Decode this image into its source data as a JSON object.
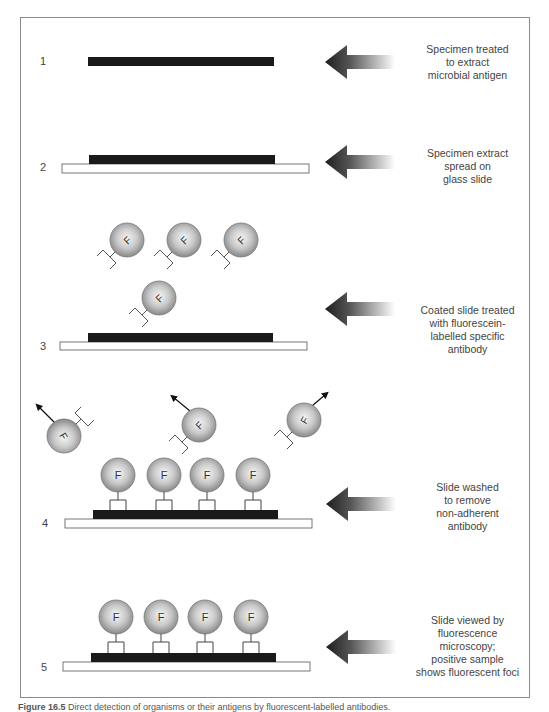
{
  "figure": {
    "caption_label": "Figure 16.5",
    "caption_text": " Direct detection of organisms or their antigens by fluorescent-labelled antibodies.",
    "colors": {
      "frame": "#8a8a8a",
      "antigen_band": "#1a1a1a",
      "slide_fill": "#ffffff",
      "slide_stroke": "#555555",
      "sphere_light": "#f4f4f4",
      "sphere_dark": "#8c8c8c",
      "arrow_dark": "#1e1e1e",
      "arrow_light": "#ffffff",
      "text": "#444444"
    },
    "fluorophore_letter": "F"
  },
  "steps": [
    {
      "number": "1",
      "description_lines": [
        "Specimen treated",
        "to extract",
        "microbial antigen"
      ]
    },
    {
      "number": "2",
      "description_lines": [
        "Specimen extract",
        "spread on",
        "glass slide"
      ]
    },
    {
      "number": "3",
      "description_lines": [
        "Coated slide treated",
        "with fluorescein-",
        "labelled specific",
        "antibody"
      ]
    },
    {
      "number": "4",
      "description_lines": [
        "Slide washed",
        "to remove",
        "non-adherent",
        "antibody"
      ]
    },
    {
      "number": "5",
      "description_lines": [
        "Slide viewed by",
        "fluorescence",
        "microscopy;",
        "positive sample",
        "shows fluorescent foci"
      ]
    }
  ]
}
